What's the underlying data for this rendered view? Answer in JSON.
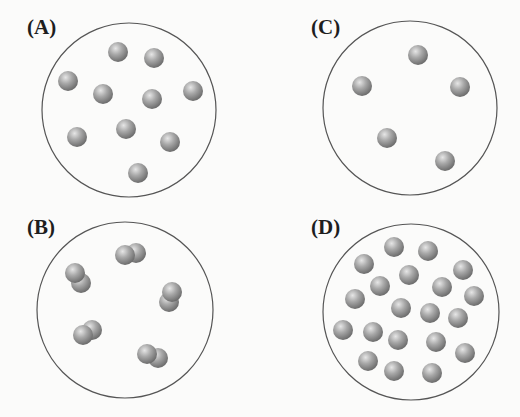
{
  "figure": {
    "width": 520,
    "height": 417,
    "colors": {
      "background": "#fbfbfa",
      "circle_stroke": "#555555",
      "particle_light": "#d9d9d9",
      "particle_mid": "#a6a6a6",
      "particle_dark": "#6e6e6e",
      "label": "#1e1e1e"
    },
    "particle_radius": 10,
    "panels": [
      {
        "id": "A",
        "label": "(A)",
        "label_pos": [
          27,
          17
        ],
        "container": {
          "cx": 129,
          "cy": 110,
          "r": 87
        },
        "description": "10 single atoms",
        "particles": [
          [
            118,
            52
          ],
          [
            154,
            58
          ],
          [
            68,
            81
          ],
          [
            103,
            94
          ],
          [
            152,
            99
          ],
          [
            193,
            91
          ],
          [
            77,
            137
          ],
          [
            126,
            129
          ],
          [
            170,
            142
          ],
          [
            138,
            173
          ]
        ],
        "molecules": []
      },
      {
        "id": "B",
        "label": "(B)",
        "label_pos": [
          27,
          217
        ],
        "container": {
          "cx": 125,
          "cy": 310,
          "r": 88
        },
        "description": "5 diatomic molecules",
        "particles": [],
        "molecules": [
          [
            [
              125,
              255
            ],
            [
              136,
              253
            ]
          ],
          [
            [
              75,
              273
            ],
            [
              81,
              283
            ]
          ],
          [
            [
              172,
              292
            ],
            [
              169,
              302
            ]
          ],
          [
            [
              83,
              335
            ],
            [
              92,
              330
            ]
          ],
          [
            [
              147,
              354
            ],
            [
              158,
              358
            ]
          ]
        ]
      },
      {
        "id": "C",
        "label": "(C)",
        "label_pos": [
          311,
          17
        ],
        "container": {
          "cx": 410,
          "cy": 108,
          "r": 87
        },
        "description": "5 single atoms",
        "particles": [
          [
            418,
            55
          ],
          [
            362,
            86
          ],
          [
            460,
            87
          ],
          [
            387,
            138
          ],
          [
            445,
            161
          ]
        ],
        "molecules": []
      },
      {
        "id": "D",
        "label": "(D)",
        "label_pos": [
          311,
          217
        ],
        "container": {
          "cx": 411,
          "cy": 312,
          "r": 88
        },
        "description": "20 single atoms",
        "particles": [
          [
            394,
            247
          ],
          [
            428,
            251
          ],
          [
            364,
            264
          ],
          [
            463,
            270
          ],
          [
            409,
            275
          ],
          [
            380,
            286
          ],
          [
            442,
            287
          ],
          [
            355,
            299
          ],
          [
            474,
            296
          ],
          [
            401,
            308
          ],
          [
            430,
            313
          ],
          [
            458,
            318
          ],
          [
            343,
            330
          ],
          [
            373,
            332
          ],
          [
            398,
            340
          ],
          [
            436,
            342
          ],
          [
            465,
            353
          ],
          [
            368,
            361
          ],
          [
            394,
            371
          ],
          [
            432,
            373
          ]
        ],
        "molecules": []
      }
    ]
  }
}
